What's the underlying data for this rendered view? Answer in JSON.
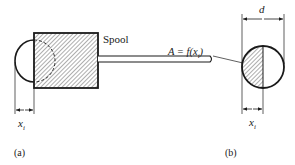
{
  "figure_a": {
    "spool_label": "Spool",
    "dimension_label": "x",
    "dimension_sub": "i",
    "panel_label": "(a)"
  },
  "figure_b": {
    "area_label_prefix": "A = f(x",
    "area_label_sub": "i",
    "area_label_suffix": ")",
    "diameter_label": "d",
    "dimension_label": "x",
    "dimension_sub": "i",
    "panel_label": "(b)"
  },
  "colors": {
    "stroke": "#1a1a1a",
    "hatch": "#333333",
    "background": "#ffffff"
  }
}
